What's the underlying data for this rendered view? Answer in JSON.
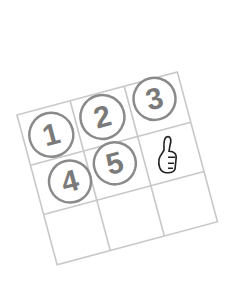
{
  "illustration": {
    "description": "Rotated 3x3 grid with circled numbers and a thumbs-up",
    "grid": {
      "rows": 3,
      "cols": 3,
      "rotation_deg": -15,
      "line_color": "#c8c8c8"
    },
    "cells": [
      {
        "row": 0,
        "col": 0,
        "content": "1",
        "type": "circled-number"
      },
      {
        "row": 0,
        "col": 1,
        "content": "2",
        "type": "circled-number"
      },
      {
        "row": 0,
        "col": 2,
        "content": "3",
        "type": "circled-number"
      },
      {
        "row": 1,
        "col": 0,
        "content": "4",
        "type": "circled-number"
      },
      {
        "row": 1,
        "col": 1,
        "content": "5",
        "type": "circled-number"
      },
      {
        "row": 1,
        "col": 2,
        "content": "thumbs-up",
        "type": "icon"
      },
      {
        "row": 2,
        "col": 0,
        "content": "",
        "type": "empty"
      },
      {
        "row": 2,
        "col": 1,
        "content": "",
        "type": "empty"
      },
      {
        "row": 2,
        "col": 2,
        "content": "",
        "type": "empty"
      }
    ],
    "colors": {
      "circle": "#8a8a8a",
      "digit": "#7a7a7a",
      "icon": "#222222"
    }
  }
}
